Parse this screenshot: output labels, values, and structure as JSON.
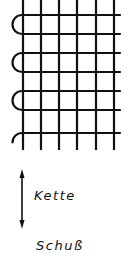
{
  "diagram": {
    "type": "woven-fabric-selvage",
    "colors": {
      "ink": "#111111",
      "background": "#ffffff"
    },
    "warp_threads_count": 6,
    "weft_threads_count": 7,
    "selvage_loops_count": 3,
    "labels": {
      "warp": "Kette",
      "weft": "Schuß"
    },
    "arrow": {
      "direction": "vertical-bidirectional",
      "meaning": "warp direction"
    }
  }
}
